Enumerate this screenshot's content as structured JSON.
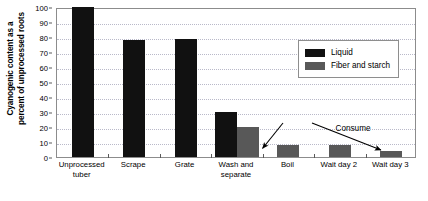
{
  "chart_data": {
    "type": "bar",
    "title": "",
    "xlabel": "",
    "ylabel": "Cyanogenic content as a percent of unprocessed roots",
    "ylim": [
      0,
      100
    ],
    "yticks": [
      0,
      10,
      20,
      30,
      40,
      50,
      60,
      70,
      80,
      90,
      100
    ],
    "grid": true,
    "legend_position": "upper-right-inside",
    "categories": [
      "Unprocessed tuber",
      "Scrape",
      "Grate",
      "Wash and separate",
      "Boil",
      "Wait day 2",
      "Wait day 3"
    ],
    "series": [
      {
        "name": "Liquid",
        "color": "#111111",
        "values": [
          100,
          78,
          79,
          30,
          null,
          null,
          null
        ]
      },
      {
        "name": "Fiber and starch",
        "color": "#585858",
        "values": [
          null,
          null,
          null,
          20,
          8,
          8,
          4
        ]
      }
    ],
    "annotations": [
      {
        "text": "Consume",
        "points_to": [
          "Boil",
          "Wait day 3"
        ]
      }
    ]
  },
  "axis": {
    "y_title_lines": [
      "Cyanogenic content as a",
      "percent of unprocessed roots"
    ],
    "y_tick_labels": [
      "100",
      "90",
      "80",
      "70",
      "60",
      "50",
      "40",
      "30",
      "20",
      "10",
      "0"
    ]
  },
  "legend": {
    "items": [
      {
        "label": "Liquid",
        "color": "#111111"
      },
      {
        "label": "Fiber and starch",
        "color": "#585858"
      }
    ]
  },
  "annotation": {
    "consume_label": "Consume"
  },
  "x_labels": [
    {
      "line1": "Unprocessed",
      "line2": "tuber"
    },
    {
      "line1": "Scrape",
      "line2": ""
    },
    {
      "line1": "Grate",
      "line2": ""
    },
    {
      "line1": "Wash and",
      "line2": "separate"
    },
    {
      "line1": "Boil",
      "line2": ""
    },
    {
      "line1": "Wait day 2",
      "line2": ""
    },
    {
      "line1": "Wait day 3",
      "line2": ""
    }
  ]
}
